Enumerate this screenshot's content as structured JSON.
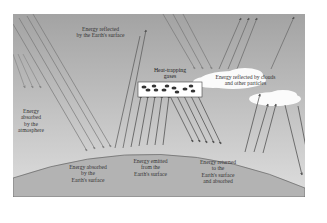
{
  "diagram": {
    "colors": {
      "sky_top": "#9a9a9a",
      "sky_bottom": "#dcdcdc",
      "earth": "#b4b4b4",
      "arrow": "#555555",
      "cloud": "#ffffff",
      "gas_box": "#ffffff",
      "molecule": "#333333"
    },
    "labels": {
      "reflected_surface": "Energy reflected\nby the Earth's surface",
      "absorbed_atmosphere": "Energy\nabsorbed\nby the\natmosphere",
      "heat_trapping": "Heat-trapping\ngases",
      "reflected_clouds": "Energy reflected by clouds\nand other particles",
      "absorbed_surface": "Energy absorbed\nby the\nEarth's surface",
      "emitted_surface": "Energy emitted\nfrom the\nEarth's surface",
      "returned_surface": "Energy returned\nto the\nEarth's surface\nand absorbed"
    }
  }
}
